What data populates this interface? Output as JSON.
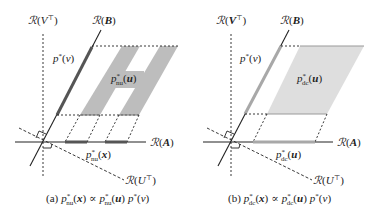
{
  "colors": {
    "axis": "#222222",
    "dark_band": "#555555",
    "gray_fill_a": "#bdbdbd",
    "gray_fill_b": "#dedede",
    "light_band_b": "#a8a8a8",
    "dotted": "#222222"
  },
  "panels": [
    {
      "id": "a",
      "labels": {
        "range_v": "ℛ(V⊤)",
        "range_b": "ℛ(B)",
        "range_a": "ℛ(A)",
        "range_u": "ℛ(U⊤)",
        "p_v": "p*(v)",
        "p_u": "p*nu(u)",
        "p_x": "p*nu(x)"
      },
      "caption": {
        "prefix": "(a)",
        "lhs": "p*nu(x)",
        "rel": "∝",
        "rhs": "p*nu(u) p*(v)"
      }
    },
    {
      "id": "b",
      "labels": {
        "range_v": "ℛ(V⊤)",
        "range_b": "ℛ(B)",
        "range_a": "ℛ(A)",
        "range_u": "ℛ(U⊤)",
        "p_v": "p*(v)",
        "p_u": "p*dc(u)",
        "p_x": "p*dc(u)"
      },
      "caption": {
        "prefix": "(b)",
        "lhs": "p*dc(x)",
        "rel": "∝",
        "rhs": "p*dc(u) p*(v)"
      }
    }
  ],
  "text": {
    "R": "ℛ",
    "V": "V",
    "T": "⊤",
    "B": "B",
    "A": "A",
    "U": "U",
    "p": "p",
    "star": "*",
    "v": "v",
    "u": "u",
    "x": "x",
    "nu": "nu",
    "dc": "dc",
    "lp": "(",
    "rp": ")",
    "prop": "∝",
    "cap_a": "(a)",
    "cap_b": "(b)"
  }
}
